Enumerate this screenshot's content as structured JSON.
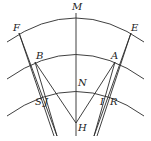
{
  "diagram": {
    "stroke_color": "#2a2a2a",
    "labels": {
      "M": "M",
      "F": "F",
      "E": "E",
      "B": "B",
      "A": "A",
      "N": "N",
      "S": "S",
      "J": "J",
      "I": "I",
      "R": "R",
      "H": "H"
    }
  }
}
